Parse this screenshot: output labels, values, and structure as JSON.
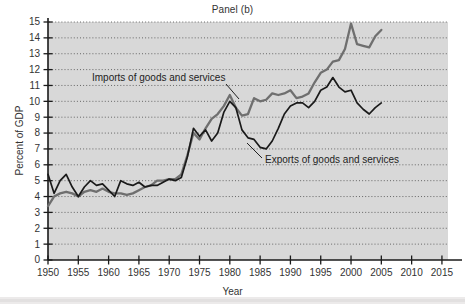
{
  "figure": {
    "title": "Panel (b)",
    "x_axis_title": "Year",
    "y_axis_title": "Percent of GDP"
  },
  "annotations": {
    "imports_label": "Imports of goods and services",
    "exports_label": "Exports of goods and services"
  },
  "colors": {
    "plot_background": "#d8d8d8",
    "figure_background": "#ffffff",
    "axis": "#1a1a1a",
    "gridline": "#5a5a5a",
    "imports_line": "#6f6f6f",
    "exports_line": "#1a1a1a",
    "text": "#333333"
  },
  "chart_data": {
    "type": "line",
    "title": "Panel (b)",
    "xlabel": "Year",
    "ylabel": "Percent of GDP",
    "xlim": [
      1950,
      2016
    ],
    "ylim": [
      0,
      15
    ],
    "xticks": [
      1950,
      1955,
      1960,
      1965,
      1970,
      1975,
      1980,
      1985,
      1990,
      1995,
      2000,
      2005,
      2010,
      2015
    ],
    "yticks": [
      0,
      1,
      2,
      3,
      4,
      5,
      6,
      7,
      8,
      9,
      10,
      11,
      12,
      13,
      14,
      15
    ],
    "grid": "horizontal-dotted",
    "legend": "inline-annotations",
    "x": [
      1950,
      1951,
      1952,
      1953,
      1954,
      1955,
      1956,
      1957,
      1958,
      1959,
      1960,
      1961,
      1962,
      1963,
      1964,
      1965,
      1966,
      1967,
      1968,
      1969,
      1970,
      1971,
      1972,
      1973,
      1974,
      1975,
      1976,
      1977,
      1978,
      1979,
      1980,
      1981,
      1982,
      1983,
      1984,
      1985,
      1986,
      1987,
      1988,
      1989,
      1990,
      1991,
      1992,
      1993,
      1994,
      1995,
      1996,
      1997,
      1998,
      1999,
      2000,
      2001,
      2002,
      2003,
      2004,
      2005
    ],
    "series": [
      {
        "name": "Exports of goods and services",
        "color": "#1a1a1a",
        "values": [
          5.4,
          4.2,
          5.0,
          5.4,
          4.6,
          4.0,
          4.6,
          5.0,
          4.7,
          4.8,
          4.4,
          4.0,
          5.0,
          4.8,
          4.7,
          4.9,
          4.6,
          4.7,
          4.7,
          4.9,
          5.1,
          5.0,
          5.2,
          6.5,
          8.3,
          7.8,
          8.2,
          7.5,
          8.0,
          9.3,
          10.0,
          9.6,
          8.2,
          7.7,
          7.6,
          7.1,
          7.0,
          7.5,
          8.3,
          9.2,
          9.7,
          9.9,
          9.9,
          9.6,
          10.0,
          10.7,
          10.9,
          11.5,
          10.9,
          10.6,
          10.7,
          9.9,
          9.5,
          9.2,
          9.6,
          9.9
        ]
      },
      {
        "name": "Imports of goods and services",
        "color": "#6f6f6f",
        "values": [
          3.4,
          4.0,
          4.2,
          4.3,
          4.2,
          4.0,
          4.3,
          4.4,
          4.3,
          4.5,
          4.3,
          4.2,
          4.2,
          4.1,
          4.2,
          4.4,
          4.6,
          4.7,
          5.0,
          5.0,
          5.1,
          5.1,
          5.4,
          6.6,
          8.0,
          7.6,
          8.3,
          8.9,
          9.2,
          9.7,
          10.4,
          9.6,
          9.1,
          9.2,
          10.2,
          10.0,
          10.1,
          10.5,
          10.4,
          10.5,
          10.7,
          10.2,
          10.3,
          10.5,
          11.2,
          11.8,
          12.0,
          12.5,
          12.6,
          13.3,
          14.9,
          13.6,
          13.5,
          13.4,
          14.1,
          14.5
        ]
      }
    ],
    "annotations": [
      {
        "text": "Imports of goods and services",
        "points_to_year": 1977,
        "points_to_value": 8.9
      },
      {
        "text": "Exports of goods and services",
        "points_to_year": 1986,
        "points_to_value": 7.0
      }
    ]
  }
}
